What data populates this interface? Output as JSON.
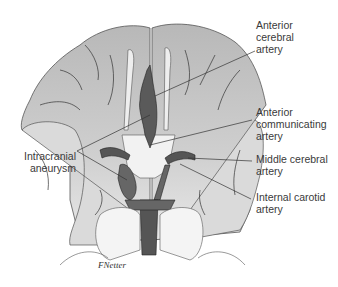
{
  "figure": {
    "signature": "F.Netter-style artist signature",
    "colors": {
      "brain_fill": "#c4c4c4",
      "brain_light": "#e6e6e6",
      "artery": "#555555",
      "artery_dark": "#333333",
      "outline": "#3a3a3a",
      "label_text": "#3a3a3a"
    }
  },
  "labels": {
    "anterior_cerebral": {
      "line1": "Anterior",
      "line2": "cerebral",
      "line3": "artery"
    },
    "anterior_communicating": {
      "line1": "Anterior",
      "line2": "communicating",
      "line3": "artery"
    },
    "middle_cerebral": {
      "line1": "Middle cerebral",
      "line2": "artery"
    },
    "internal_carotid": {
      "line1": "Internal carotid",
      "line2": "artery"
    },
    "aneurysm": {
      "line1": "Intracranial",
      "line2": "aneurysm"
    }
  }
}
